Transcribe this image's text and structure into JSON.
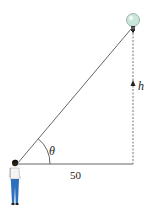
{
  "diagram": {
    "labels": {
      "angle": "θ",
      "height": "h",
      "base": "50"
    },
    "elements": {
      "observer": "person",
      "light_source": "light-bulb"
    },
    "colors": {
      "line": "#555555",
      "bulb": "#bfe0d4",
      "pants": "#2a6bb8",
      "shirt": "#ffffff",
      "hair": "#1a1a1a"
    }
  }
}
